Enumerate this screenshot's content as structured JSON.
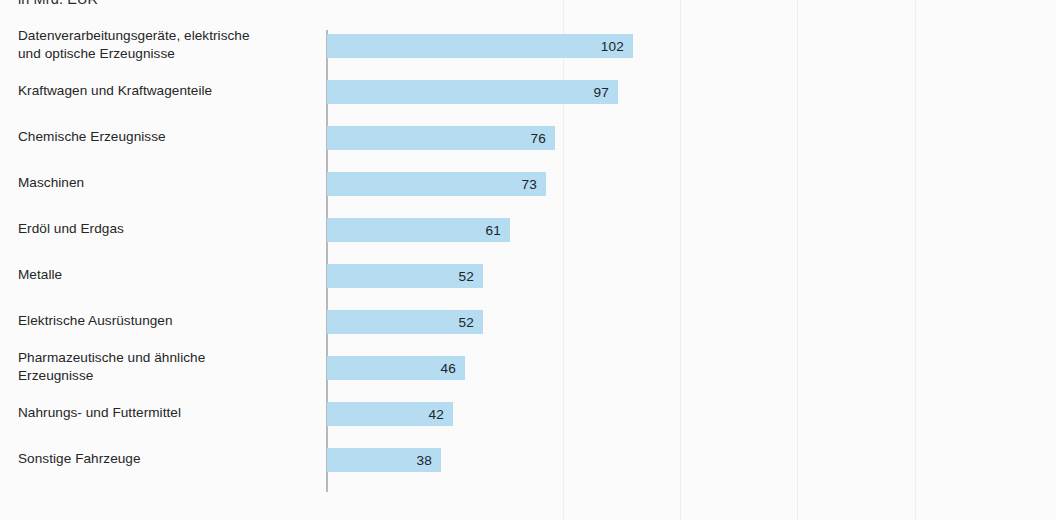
{
  "subtitle": "in Mrd. EUR",
  "axis": {
    "origin_label": "0",
    "px_per_unit": 3.0
  },
  "gridlines_x": [
    563,
    680,
    797,
    915
  ],
  "colors": {
    "bar_fill": "#b5dcf0",
    "label_text": "#262626",
    "value_text": "#20242b",
    "axis_line": "#b6b8ba",
    "background": "#fbfbfc"
  },
  "chart_data": {
    "type": "bar",
    "orientation": "horizontal",
    "title": "",
    "subtitle": "in Mrd. EUR",
    "xlabel": "",
    "ylabel": "",
    "xlim": [
      0,
      110
    ],
    "grid": false,
    "legend": null,
    "units": "Mrd. EUR",
    "categories": [
      "Datenverarbeitungsgeräte, elektrische und optische Erzeugnisse",
      "Kraftwagen und Kraftwagenteile",
      "Chemische Erzeugnisse",
      "Maschinen",
      "Erdöl und Erdgas",
      "Metalle",
      "Elektrische Ausrüstungen",
      "Pharmazeutische und ähnliche Erzeugnisse",
      "Nahrungs- und Futtermittel",
      "Sonstige Fahrzeuge"
    ],
    "values": [
      102,
      97,
      76,
      73,
      61,
      52,
      52,
      46,
      42,
      38
    ]
  },
  "rows": [
    {
      "label_line1": "Datenverarbeitungsgeräte, elektrische",
      "label_line2": "und optische Erzeugnisse",
      "value": "102",
      "value_num": 102
    },
    {
      "label_line1": "Kraftwagen und Kraftwagenteile",
      "label_line2": "",
      "value": "97",
      "value_num": 97
    },
    {
      "label_line1": "Chemische Erzeugnisse",
      "label_line2": "",
      "value": "76",
      "value_num": 76
    },
    {
      "label_line1": "Maschinen",
      "label_line2": "",
      "value": "73",
      "value_num": 73
    },
    {
      "label_line1": "Erdöl und Erdgas",
      "label_line2": "",
      "value": "61",
      "value_num": 61
    },
    {
      "label_line1": "Metalle",
      "label_line2": "",
      "value": "52",
      "value_num": 52
    },
    {
      "label_line1": "Elektrische Ausrüstungen",
      "label_line2": "",
      "value": "52",
      "value_num": 52
    },
    {
      "label_line1": "Pharmazeutische und ähnliche",
      "label_line2": "Erzeugnisse",
      "value": "46",
      "value_num": 46
    },
    {
      "label_line1": "Nahrungs- und Futtermittel",
      "label_line2": "",
      "value": "42",
      "value_num": 42
    },
    {
      "label_line1": "Sonstige Fahrzeuge",
      "label_line2": "",
      "value": "38",
      "value_num": 38
    }
  ]
}
